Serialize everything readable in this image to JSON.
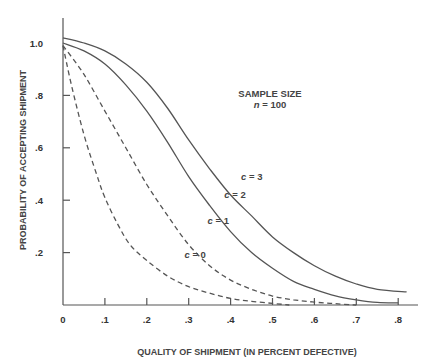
{
  "chart_data": {
    "type": "line",
    "title": "",
    "xlabel": "QUALITY OF SHIPMENT (IN PERCENT DEFECTIVE)",
    "ylabel": "PROBABILITY OF ACCEPTING SHIPMENT",
    "xlim": [
      0,
      0.84
    ],
    "ylim": [
      0,
      1.05
    ],
    "grid": false,
    "x_ticks": [
      0,
      0.1,
      0.2,
      0.3,
      0.4,
      0.5,
      0.6,
      0.7,
      0.8
    ],
    "x_tick_labels": [
      "0",
      ".1",
      ".2",
      ".3",
      ".4",
      ".5",
      ".6",
      ".7",
      ".8"
    ],
    "y_ticks": [
      0.2,
      0.4,
      0.6,
      0.8,
      1.0
    ],
    "y_tick_labels": [
      ".2",
      ".4",
      ".6",
      ".8",
      "1.0"
    ],
    "annotations": [
      {
        "text": "SAMPLE SIZE",
        "x": 0.51,
        "y": 0.82
      },
      {
        "text": "n = 100",
        "x": 0.51,
        "y": 0.77
      }
    ],
    "series": [
      {
        "name": "c = 0",
        "style": "dashed",
        "label_pos": {
          "x": 0.29,
          "y": 0.19
        },
        "x": [
          0,
          0.02,
          0.05,
          0.08,
          0.1,
          0.13,
          0.16,
          0.2,
          0.25,
          0.3,
          0.35,
          0.4,
          0.45,
          0.5,
          0.54
        ],
        "y": [
          0.99,
          0.84,
          0.65,
          0.5,
          0.41,
          0.31,
          0.23,
          0.17,
          0.11,
          0.07,
          0.045,
          0.025,
          0.014,
          0.006,
          0.0
        ]
      },
      {
        "name": "c = 1",
        "style": "dashed",
        "label_pos": {
          "x": 0.345,
          "y": 0.32
        },
        "x": [
          0,
          0.05,
          0.1,
          0.15,
          0.2,
          0.25,
          0.3,
          0.35,
          0.4,
          0.45,
          0.5,
          0.55,
          0.6,
          0.65,
          0.7
        ],
        "y": [
          0.99,
          0.88,
          0.74,
          0.6,
          0.46,
          0.34,
          0.23,
          0.15,
          0.095,
          0.06,
          0.034,
          0.02,
          0.011,
          0.005,
          0.0
        ]
      },
      {
        "name": "c = 2",
        "style": "solid",
        "label_pos": {
          "x": 0.385,
          "y": 0.42
        },
        "x": [
          0,
          0.05,
          0.1,
          0.15,
          0.2,
          0.25,
          0.3,
          0.35,
          0.4,
          0.45,
          0.5,
          0.55,
          0.6,
          0.65,
          0.7,
          0.75,
          0.8
        ],
        "y": [
          1.0,
          0.97,
          0.92,
          0.84,
          0.74,
          0.62,
          0.49,
          0.38,
          0.28,
          0.2,
          0.14,
          0.09,
          0.06,
          0.035,
          0.02,
          0.01,
          0.008
        ]
      },
      {
        "name": "c = 3",
        "style": "solid",
        "label_pos": {
          "x": 0.425,
          "y": 0.49
        },
        "x": [
          0,
          0.05,
          0.1,
          0.15,
          0.2,
          0.25,
          0.3,
          0.35,
          0.4,
          0.45,
          0.5,
          0.55,
          0.6,
          0.65,
          0.7,
          0.75,
          0.82
        ],
        "y": [
          1.02,
          1.0,
          0.97,
          0.92,
          0.85,
          0.75,
          0.63,
          0.52,
          0.42,
          0.34,
          0.26,
          0.2,
          0.15,
          0.11,
          0.08,
          0.06,
          0.05
        ]
      }
    ]
  }
}
